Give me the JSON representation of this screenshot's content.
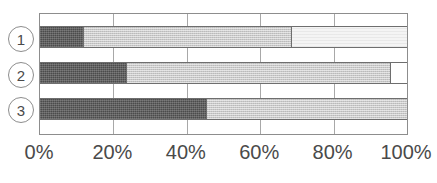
{
  "chart_data": {
    "type": "bar",
    "orientation": "horizontal",
    "stacked": true,
    "normalized_percent": true,
    "title": "",
    "xlabel": "",
    "ylabel": "",
    "xlim": [
      0,
      100
    ],
    "grid": true,
    "legend": "none",
    "categories": [
      "1",
      "2",
      "3"
    ],
    "xticks": [
      0,
      20,
      40,
      60,
      80,
      100
    ],
    "xtick_labels": [
      "0%",
      "20%",
      "40%",
      "60%",
      "80%",
      "100%"
    ],
    "series": [
      {
        "name": "segment-1",
        "color": "#4b4b4b",
        "fill": "dark",
        "values": [
          11.6,
          23.5,
          45.2
        ]
      },
      {
        "name": "segment-2",
        "color": "#c9c9c9",
        "fill": "mid",
        "values": [
          56.9,
          71.9,
          54.8
        ]
      },
      {
        "name": "segment-3",
        "color": "#f4f4f4",
        "fill": "light",
        "values": [
          31.5,
          4.6,
          0
        ]
      }
    ],
    "rows": [
      {
        "label": "1",
        "segments": [
          {
            "name": "segment-1",
            "start": 0,
            "end": 11.6,
            "width": 11.6,
            "fill": "dark"
          },
          {
            "name": "segment-2",
            "start": 11.6,
            "end": 68.5,
            "width": 56.9,
            "fill": "mid"
          },
          {
            "name": "segment-3",
            "start": 68.5,
            "end": 100.0,
            "width": 31.5,
            "fill": "light"
          }
        ]
      },
      {
        "label": "2",
        "segments": [
          {
            "name": "segment-1",
            "start": 0,
            "end": 23.5,
            "width": 23.5,
            "fill": "dark"
          },
          {
            "name": "segment-2",
            "start": 23.5,
            "end": 95.4,
            "width": 71.9,
            "fill": "mid"
          },
          {
            "name": "segment-3",
            "start": 95.4,
            "end": 100.0,
            "width": 4.6,
            "fill": "white"
          }
        ]
      },
      {
        "label": "3",
        "segments": [
          {
            "name": "segment-1",
            "start": 0,
            "end": 45.2,
            "width": 45.2,
            "fill": "dark"
          },
          {
            "name": "segment-2",
            "start": 45.2,
            "end": 100.0,
            "width": 54.8,
            "fill": "mid"
          }
        ]
      }
    ]
  }
}
